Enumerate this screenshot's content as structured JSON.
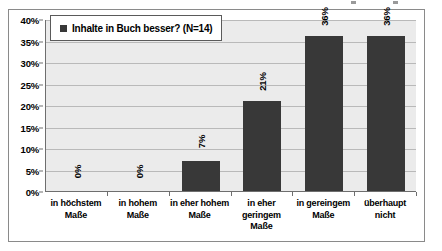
{
  "chart_data": {
    "type": "bar",
    "title": "",
    "subtitle": "",
    "xlabel": "",
    "ylabel": "",
    "categories": [
      "in höchstem Maße",
      "in hohem Maße",
      "in eher hohem Maße",
      "in eher geringem Maße",
      "in gereingem Maße",
      "überhaupt nicht"
    ],
    "values": [
      0,
      0,
      7,
      21,
      36,
      36
    ],
    "data_labels": [
      "0%",
      "0%",
      "7%",
      "21%",
      "36%",
      "36%"
    ],
    "series": [
      {
        "name": "Inhalte in Buch besser? (N=14)",
        "values": [
          0,
          0,
          7,
          21,
          36,
          36
        ]
      }
    ],
    "ylim": [
      0,
      40
    ],
    "y_tick_labels": [
      "0%",
      "5%",
      "10%",
      "15%",
      "20%",
      "25%",
      "30%",
      "35%",
      "40%"
    ],
    "y_tick_values": [
      0,
      5,
      10,
      15,
      20,
      25,
      30,
      35,
      40
    ],
    "grid": true,
    "legend_position": "top-left",
    "value_label_rotation": "vertical",
    "colors": {
      "bar": "#383838",
      "plot_background": "#ebebeb",
      "gridline": "#b9b9b9",
      "axis": "#6e6e6e",
      "frame_border": "#8a8a8a",
      "text": "#000000"
    }
  },
  "legend": {
    "swatch_name": "legend-swatch",
    "label": "Inhalte in Buch besser? (N=14)"
  }
}
